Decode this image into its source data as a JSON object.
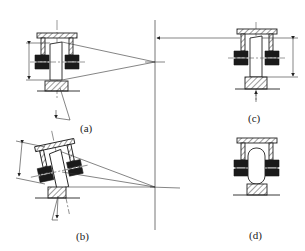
{
  "figure": {
    "type": "mechanical-diagram",
    "panels": [
      {
        "id": "a",
        "label": "(a)"
      },
      {
        "id": "b",
        "label": "(b)"
      },
      {
        "id": "c",
        "label": "(c)"
      },
      {
        "id": "d",
        "label": "(d)"
      }
    ]
  },
  "colors": {
    "ink": "#222222",
    "reference_line": "#777777",
    "background": "#ffffff"
  }
}
